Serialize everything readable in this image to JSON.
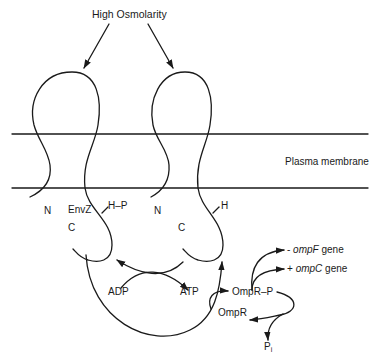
{
  "diagram": {
    "title": "High Osmolarity",
    "membrane_label": "Plasma membrane",
    "left_protein": {
      "n_label": "N",
      "name_label": "EnvZ",
      "c_label": "C",
      "site_label": "H–P"
    },
    "right_protein": {
      "n_label": "N",
      "c_label": "C",
      "site_label": "H"
    },
    "cycle": {
      "adp_label": "ADP",
      "atp_label": "ATP"
    },
    "regulator": {
      "phospho_label": "OmpR–P",
      "unphospho_label": "OmpR",
      "pi_label": "P",
      "pi_sub": "i"
    },
    "genes": {
      "ompf_sign": "- ",
      "ompf_name": "ompF",
      "ompf_suffix": " gene",
      "ompc_sign": "+ ",
      "ompc_name": "ompC",
      "ompc_suffix": " gene"
    },
    "colors": {
      "line": "#1a1a1a",
      "background": "#ffffff"
    }
  }
}
